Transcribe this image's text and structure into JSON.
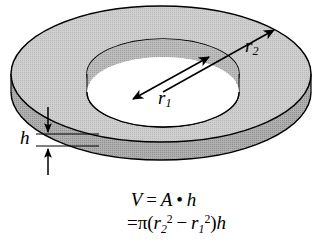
{
  "figure": {
    "name": "annular-washer-volume-figure",
    "shape": "annulus-disk"
  },
  "colors": {
    "top_face": "#c9c9c9",
    "side_wall": "#a9a9a9",
    "inner_wall": "#b5b5b5",
    "hole_fill": "#ffffff",
    "outline": "#000000",
    "background": "#ffffff",
    "text": "#000000"
  },
  "labels": {
    "outer_radius": {
      "symbol": "r",
      "subscript": "2"
    },
    "inner_radius": {
      "symbol": "r",
      "subscript": "1"
    },
    "thickness": {
      "symbol": "h"
    }
  },
  "formula": {
    "line1": {
      "volume_symbol": "V",
      "equals": "=",
      "area_symbol": "A",
      "dot": "•",
      "height_symbol": "h"
    },
    "line2": {
      "equals": "=",
      "pi": "π",
      "open_paren": "(",
      "r_outer": "r",
      "r_outer_sub": "2",
      "r_outer_sup": "2",
      "minus": "−",
      "r_inner": "r",
      "r_inner_sub": "1",
      "r_inner_sup": "2",
      "close_paren": ")",
      "height_symbol": "h"
    }
  },
  "geometry": {
    "outer_ellipse": {
      "cx": 161,
      "cy": 74,
      "rx": 150,
      "ry": 68
    },
    "inner_ellipse": {
      "cx": 163,
      "cy": 74,
      "rx": 76,
      "ry": 35
    },
    "wall_thickness_px": 18
  }
}
